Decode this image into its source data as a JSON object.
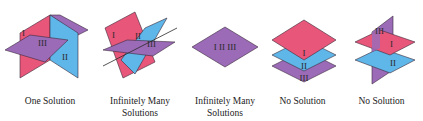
{
  "colors": {
    "plane_I": "#e8567a",
    "plane_II": "#5fb6e8",
    "plane_III": "#9b6bb8",
    "edge": "#3a2a3a"
  },
  "figures": [
    {
      "id": "one-solution",
      "caption": [
        "One Solution"
      ],
      "labels": {
        "I": "I",
        "II": "II",
        "III": "III"
      }
    },
    {
      "id": "infinitely-many-line",
      "caption": [
        "Infinitely Many",
        "Solutions"
      ],
      "labels": {
        "I": "I",
        "II": "II",
        "III": "III"
      }
    },
    {
      "id": "infinitely-many-coincident",
      "caption": [
        "Infinitely Many",
        "Solutions"
      ],
      "labels": {
        "combined": "I II III"
      }
    },
    {
      "id": "no-solution-parallel",
      "caption": [
        "No Solution"
      ],
      "labels": {
        "I": "I",
        "II": "II",
        "III": "III"
      }
    },
    {
      "id": "no-solution-mixed",
      "caption": [
        "No Solution"
      ],
      "labels": {
        "I": "I",
        "II": "II",
        "III": "III"
      }
    }
  ]
}
